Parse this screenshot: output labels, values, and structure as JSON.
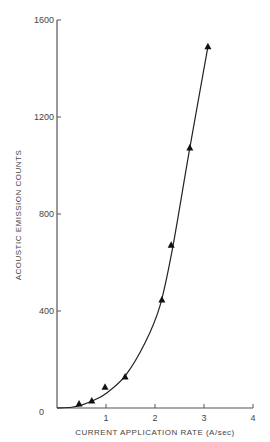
{
  "chart_data": {
    "type": "scatter",
    "title": "",
    "xlabel": "CURRENT APPLICATION RATE (A/sec)",
    "ylabel": "ACOUSTIC EMISSION COUNTS",
    "xlim": [
      0,
      4
    ],
    "ylim": [
      0,
      1600
    ],
    "x_ticks": [
      "0",
      "1",
      "2",
      "3",
      "4"
    ],
    "y_ticks": [
      "0",
      "400",
      "800",
      "1200",
      "1600"
    ],
    "grid": false,
    "marker": "triangle",
    "fit_curve": "smooth monotonic curve through points",
    "series": [
      {
        "name": "Acoustic emission counts",
        "x": [
          0.45,
          0.71,
          0.98,
          1.39,
          2.14,
          2.33,
          2.71,
          3.08
        ],
        "y": [
          16,
          29,
          86,
          128,
          445,
          671,
          1072,
          1490
        ]
      }
    ]
  }
}
